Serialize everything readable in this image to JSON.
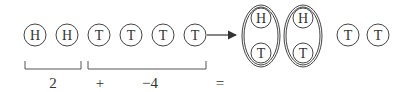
{
  "diagram": {
    "left_group": [
      {
        "label": "H",
        "x": 35
      },
      {
        "label": "H",
        "x": 67
      },
      {
        "label": "T",
        "x": 99
      },
      {
        "label": "T",
        "x": 131
      },
      {
        "label": "T",
        "x": 163
      },
      {
        "label": "T",
        "x": 195
      }
    ],
    "pairs": [
      {
        "top": "H",
        "bottom": "T",
        "x": 261
      },
      {
        "top": "H",
        "bottom": "T",
        "x": 303
      }
    ],
    "right_group": [
      {
        "label": "T",
        "x": 348
      },
      {
        "label": "T",
        "x": 378
      }
    ],
    "equation": {
      "term1": "2",
      "plus": "+",
      "term2": "−4",
      "equals": "="
    },
    "colors": {
      "stroke": "#444444",
      "text": "#333333"
    }
  }
}
